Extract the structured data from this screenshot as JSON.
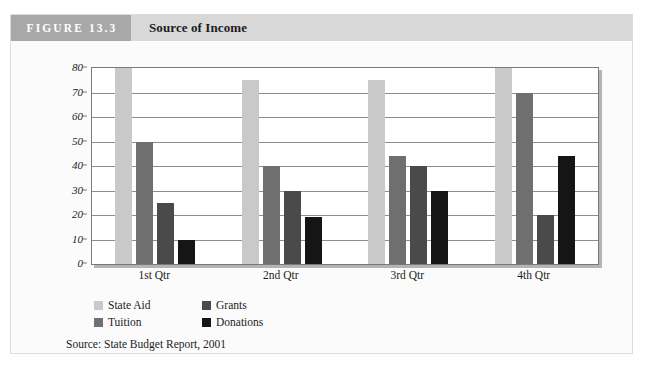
{
  "figure": {
    "number_label": "FIGURE 13.3",
    "title": "Source of Income",
    "source_note": "Source: State Budget Report, 2001",
    "number_band_color": "#a8a8a8",
    "header_band_color": "#d8d8d8"
  },
  "chart_data": {
    "type": "bar",
    "title": "Source of Income",
    "xlabel": "",
    "ylabel": "",
    "ylim": [
      0,
      80
    ],
    "yticks": [
      0,
      10,
      20,
      30,
      40,
      50,
      60,
      70,
      80
    ],
    "ytick_labels": [
      "0",
      "10",
      "20",
      "30",
      "40",
      "50",
      "60",
      "70",
      "80"
    ],
    "grid": true,
    "legend_position": "below-left",
    "categories": [
      "1st Qtr",
      "2nd Qtr",
      "3rd Qtr",
      "4th Qtr"
    ],
    "series": [
      {
        "name": "State Aid",
        "color": "#c9c9c9",
        "values": [
          84,
          75,
          75,
          84
        ],
        "clipped": [
          true,
          false,
          false,
          true
        ]
      },
      {
        "name": "Tuition",
        "color": "#6f6f6f",
        "values": [
          50,
          40,
          44,
          70
        ],
        "clipped": [
          false,
          false,
          false,
          false
        ]
      },
      {
        "name": "Grants",
        "color": "#4a4a4a",
        "values": [
          25,
          30,
          40,
          20
        ],
        "clipped": [
          false,
          false,
          false,
          false
        ]
      },
      {
        "name": "Donations",
        "color": "#151515",
        "values": [
          10,
          19,
          30,
          44
        ],
        "clipped": [
          false,
          false,
          false,
          false
        ]
      }
    ],
    "legend_order": [
      "State Aid",
      "Grants",
      "Tuition",
      "Donations"
    ]
  }
}
